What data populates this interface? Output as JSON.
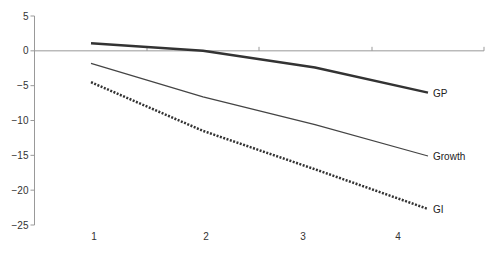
{
  "chart_data": {
    "type": "line",
    "title": "",
    "xlabel": "",
    "ylabel": "",
    "categories": [
      "1",
      "2",
      "3",
      "4"
    ],
    "x": [
      1,
      2,
      3,
      4
    ],
    "ylim": [
      -25,
      5
    ],
    "yticks": [
      5,
      0,
      -5,
      -10,
      -15,
      -20,
      -25
    ],
    "ytick_labels": [
      "5",
      "0",
      "−5",
      "−10",
      "−15",
      "−20",
      "−25"
    ],
    "grid": false,
    "legend": "inline labels at line ends",
    "series": [
      {
        "name": "GP",
        "values": [
          1.1,
          0.0,
          -2.4,
          -6.0
        ],
        "style": "solid-thick",
        "color": "#333333"
      },
      {
        "name": "Growth",
        "values": [
          -1.8,
          -6.6,
          -10.6,
          -15.1
        ],
        "style": "solid-thin",
        "color": "#444444"
      },
      {
        "name": "GI",
        "values": [
          -4.5,
          -11.5,
          -17.0,
          -22.7
        ],
        "style": "dotted-thick",
        "color": "#333333"
      }
    ]
  },
  "colors": {
    "axis": "#999999",
    "background": "#ffffff"
  }
}
